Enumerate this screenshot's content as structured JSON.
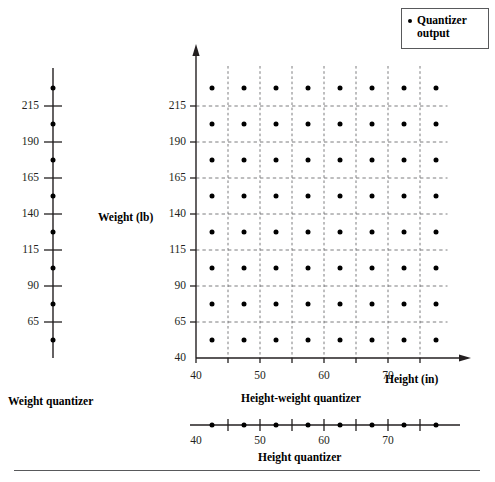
{
  "figure": {
    "legend": {
      "marker": "dot",
      "label_line1": "Quantizer",
      "label_line2": "output"
    },
    "weight_quantizer": {
      "caption": "Weight quantizer",
      "axis": "vertical",
      "tick_labels": [
        "215",
        "190",
        "165",
        "140",
        "115",
        "90",
        "65"
      ],
      "tick_values": [
        215,
        190,
        165,
        140,
        115,
        90,
        65
      ],
      "output_levels": [
        227.5,
        202.5,
        177.5,
        152.5,
        127.5,
        102.5,
        77.5,
        52.5
      ]
    },
    "height_quantizer": {
      "caption": "Height quantizer",
      "axis": "horizontal",
      "tick_labels": [
        "40",
        "50",
        "60",
        "70"
      ],
      "tick_values": [
        45,
        50,
        55,
        60,
        65,
        70,
        75
      ],
      "labeled_ticks": [
        40,
        50,
        60,
        70
      ],
      "output_levels": [
        42.5,
        47.5,
        52.5,
        57.5,
        62.5,
        67.5,
        72.5,
        77.5
      ]
    },
    "main_plot": {
      "caption": "Height-weight quantizer",
      "xlabel": "Height (in)",
      "ylabel": "Weight (lb)",
      "x_tick_labels": [
        "40",
        "50",
        "60",
        "70"
      ],
      "y_tick_labels": [
        "215",
        "190",
        "165",
        "140",
        "115",
        "90",
        "65",
        "40"
      ]
    }
  },
  "chart_data": {
    "type": "scatter",
    "title": "Height-weight quantizer",
    "xlabel": "Height (in)",
    "ylabel": "Weight (lb)",
    "xlim": [
      40,
      80
    ],
    "ylim": [
      40,
      240
    ],
    "x_ticks": [
      40,
      50,
      60,
      70
    ],
    "y_ticks": [
      40,
      65,
      90,
      115,
      140,
      165,
      190,
      215
    ],
    "grid": "dashed",
    "grid_x": [
      45,
      50,
      55,
      60,
      65,
      70,
      75
    ],
    "grid_y": [
      65,
      90,
      115,
      140,
      165,
      190,
      215
    ],
    "legend": [
      "Quantizer output"
    ],
    "legend_position": "top-right",
    "x_levels": [
      42.5,
      47.5,
      52.5,
      57.5,
      62.5,
      67.5,
      72.5,
      77.5
    ],
    "y_levels": [
      52.5,
      77.5,
      102.5,
      127.5,
      152.5,
      177.5,
      202.5,
      227.5
    ],
    "note": "8 x 8 grid of quantizer reconstruction points, one at the centre of each grid cell",
    "series": [
      {
        "name": "Quantizer output",
        "marker": "dot",
        "color": "#000000",
        "points": [
          [
            42.5,
            52.5
          ],
          [
            47.5,
            52.5
          ],
          [
            52.5,
            52.5
          ],
          [
            57.5,
            52.5
          ],
          [
            62.5,
            52.5
          ],
          [
            67.5,
            52.5
          ],
          [
            72.5,
            52.5
          ],
          [
            77.5,
            52.5
          ],
          [
            42.5,
            77.5
          ],
          [
            47.5,
            77.5
          ],
          [
            52.5,
            77.5
          ],
          [
            57.5,
            77.5
          ],
          [
            62.5,
            77.5
          ],
          [
            67.5,
            77.5
          ],
          [
            72.5,
            77.5
          ],
          [
            77.5,
            77.5
          ],
          [
            42.5,
            102.5
          ],
          [
            47.5,
            102.5
          ],
          [
            52.5,
            102.5
          ],
          [
            57.5,
            102.5
          ],
          [
            62.5,
            102.5
          ],
          [
            67.5,
            102.5
          ],
          [
            72.5,
            102.5
          ],
          [
            77.5,
            102.5
          ],
          [
            42.5,
            127.5
          ],
          [
            47.5,
            127.5
          ],
          [
            52.5,
            127.5
          ],
          [
            57.5,
            127.5
          ],
          [
            62.5,
            127.5
          ],
          [
            67.5,
            127.5
          ],
          [
            72.5,
            127.5
          ],
          [
            77.5,
            127.5
          ],
          [
            42.5,
            152.5
          ],
          [
            47.5,
            152.5
          ],
          [
            52.5,
            152.5
          ],
          [
            57.5,
            152.5
          ],
          [
            62.5,
            152.5
          ],
          [
            67.5,
            152.5
          ],
          [
            72.5,
            152.5
          ],
          [
            77.5,
            152.5
          ],
          [
            42.5,
            177.5
          ],
          [
            47.5,
            177.5
          ],
          [
            52.5,
            177.5
          ],
          [
            57.5,
            177.5
          ],
          [
            62.5,
            177.5
          ],
          [
            67.5,
            177.5
          ],
          [
            72.5,
            177.5
          ],
          [
            77.5,
            177.5
          ],
          [
            42.5,
            202.5
          ],
          [
            47.5,
            202.5
          ],
          [
            52.5,
            202.5
          ],
          [
            57.5,
            202.5
          ],
          [
            62.5,
            202.5
          ],
          [
            67.5,
            202.5
          ],
          [
            72.5,
            202.5
          ],
          [
            77.5,
            202.5
          ],
          [
            42.5,
            227.5
          ],
          [
            47.5,
            227.5
          ],
          [
            52.5,
            227.5
          ],
          [
            57.5,
            227.5
          ],
          [
            62.5,
            227.5
          ],
          [
            67.5,
            227.5
          ],
          [
            72.5,
            227.5
          ],
          [
            77.5,
            227.5
          ]
        ]
      }
    ]
  }
}
